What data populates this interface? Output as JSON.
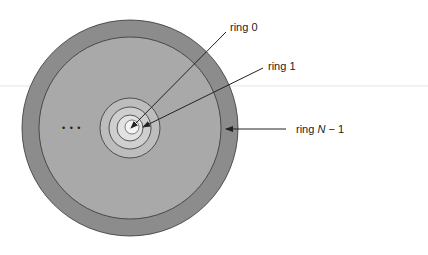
{
  "diagram": {
    "rings": [
      {
        "name": "ring 0",
        "label": "ring 0"
      },
      {
        "name": "ring 1",
        "label": "ring 1"
      },
      {
        "name": "ring N-1",
        "label_prefix": "ring ",
        "label_var": "N",
        "label_suffix": " − 1"
      }
    ],
    "ellipsis": "• • •",
    "colors": {
      "outer_ring": "#8c8c8c",
      "middle_area": "#a9a9a9",
      "inner_ring_1": "#bdbdbd",
      "inner_ring_2": "#cfcfcf",
      "inner_ring_3": "#e2e2e2",
      "center": "#f2f2f2",
      "stroke": "#333333"
    }
  }
}
